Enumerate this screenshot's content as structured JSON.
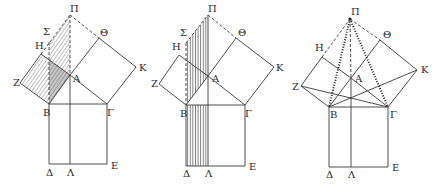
{
  "colors": {
    "line": "#3a3a3a",
    "hatch": "#555555",
    "background": "#ffffff"
  },
  "figures": [
    {
      "id": "fig1",
      "hatching": "diagonal",
      "shaded": [
        "square ZHAB",
        "parallelogram ΣΠAB"
      ],
      "labels": [
        {
          "text": "Π",
          "x": 70,
          "y": 12
        },
        {
          "text": "Θ",
          "x": 100,
          "y": 36
        },
        {
          "text": "Σ",
          "x": 43,
          "y": 35
        },
        {
          "text": "H",
          "x": 35,
          "y": 49
        },
        {
          "text": "K",
          "x": 139,
          "y": 71
        },
        {
          "text": "Z",
          "x": 13,
          "y": 86
        },
        {
          "text": "A",
          "x": 73,
          "y": 82
        },
        {
          "text": "B",
          "x": 43,
          "y": 116
        },
        {
          "text": "Γ",
          "x": 107,
          "y": 116
        },
        {
          "text": "Δ",
          "x": 46,
          "y": 176
        },
        {
          "text": "Λ",
          "x": 67,
          "y": 176
        },
        {
          "text": "E",
          "x": 111,
          "y": 169
        }
      ]
    },
    {
      "id": "fig2",
      "hatching": "vertical",
      "shaded": [
        "parallelogram ΣΠAB",
        "rectangle BΔΛ"
      ],
      "labels": [
        {
          "text": "Π",
          "x": 208,
          "y": 12
        },
        {
          "text": "Θ",
          "x": 238,
          "y": 36
        },
        {
          "text": "Σ",
          "x": 180,
          "y": 36
        },
        {
          "text": "H",
          "x": 172,
          "y": 50
        },
        {
          "text": "K",
          "x": 276,
          "y": 71
        },
        {
          "text": "Z",
          "x": 151,
          "y": 87
        },
        {
          "text": "A",
          "x": 212,
          "y": 82
        },
        {
          "text": "B",
          "x": 180,
          "y": 117
        },
        {
          "text": "Γ",
          "x": 245,
          "y": 117
        },
        {
          "text": "Δ",
          "x": 183,
          "y": 177
        },
        {
          "text": "Λ",
          "x": 205,
          "y": 177
        },
        {
          "text": "E",
          "x": 249,
          "y": 170
        }
      ]
    },
    {
      "id": "fig3",
      "hatching": "none",
      "shaded": [],
      "labels": [
        {
          "text": "Π",
          "x": 351,
          "y": 15
        },
        {
          "text": "Θ",
          "x": 383,
          "y": 38
        },
        {
          "text": "H",
          "x": 315,
          "y": 51
        },
        {
          "text": "K",
          "x": 421,
          "y": 73
        },
        {
          "text": "Z",
          "x": 292,
          "y": 90
        },
        {
          "text": "A",
          "x": 355,
          "y": 82
        },
        {
          "text": "B",
          "x": 330,
          "y": 118
        },
        {
          "text": "Γ",
          "x": 390,
          "y": 118
        },
        {
          "text": "Δ",
          "x": 326,
          "y": 178
        },
        {
          "text": "Λ",
          "x": 348,
          "y": 178
        },
        {
          "text": "E",
          "x": 392,
          "y": 171
        }
      ]
    }
  ]
}
